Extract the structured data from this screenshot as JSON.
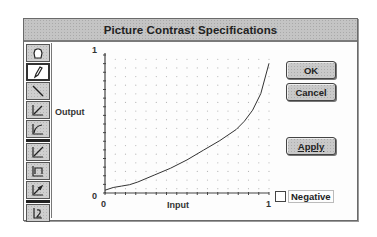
{
  "dialog": {
    "title": "Picture Contrast Specifications"
  },
  "toolbar": {
    "tools": [
      {
        "name": "hand-icon",
        "selected": false
      },
      {
        "name": "pencil-icon",
        "selected": true
      },
      {
        "name": "line-icon",
        "selected": false
      },
      {
        "name": "curve-up-icon",
        "selected": false
      },
      {
        "name": "curve-down-icon",
        "selected": false
      },
      {
        "name": "linear-icon",
        "selected": false
      },
      {
        "name": "threshold-icon",
        "selected": false
      },
      {
        "name": "gamma-icon",
        "selected": false
      },
      {
        "name": "reset-icon",
        "selected": false
      }
    ]
  },
  "graph": {
    "y_label": "Output",
    "x_label": "Input",
    "y_max_tick": "1",
    "y_min_tick": "0",
    "x_min_tick": "0",
    "x_max_tick": "1"
  },
  "buttons": {
    "ok": "OK",
    "cancel": "Cancel",
    "apply": "Apply"
  },
  "negative_checkbox": {
    "label": "Negative",
    "checked": false
  },
  "chart_data": {
    "type": "line",
    "title": "",
    "xlabel": "Input",
    "ylabel": "Output",
    "xlim": [
      0,
      1
    ],
    "ylim": [
      0,
      1
    ],
    "grid": true,
    "x": [
      0,
      0.05,
      0.1,
      0.15,
      0.2,
      0.3,
      0.4,
      0.5,
      0.6,
      0.7,
      0.8,
      0.85,
      0.9,
      0.95,
      1.0
    ],
    "series": [
      {
        "name": "contrast-curve",
        "values": [
          0.02,
          0.04,
          0.05,
          0.06,
          0.08,
          0.13,
          0.18,
          0.24,
          0.31,
          0.38,
          0.46,
          0.52,
          0.6,
          0.72,
          0.94
        ]
      }
    ]
  }
}
